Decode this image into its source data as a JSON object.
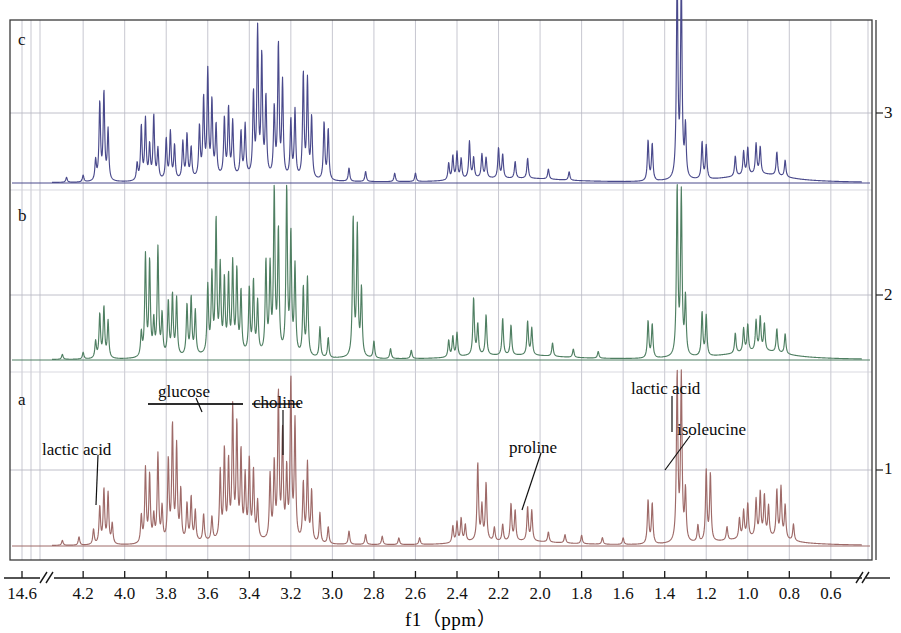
{
  "figure": {
    "kind": "nmr-spectra-stack",
    "x_axis_title": "f1（ppm）",
    "x_tick_labels": [
      "14.6",
      "4.2",
      "4.0",
      "3.8",
      "3.6",
      "3.4",
      "3.2",
      "3.0",
      "2.8",
      "2.6",
      "2.4",
      "2.2",
      "2.0",
      "1.8",
      "1.6",
      "1.4",
      "1.2",
      "1.0",
      "0.8",
      "0.6"
    ],
    "x_axis_has_break": true,
    "y_tick_labels": [
      "3",
      "2",
      "1"
    ],
    "trace_labels": [
      "c",
      "b",
      "a"
    ],
    "colors": {
      "trace_a": "#9e6a68",
      "trace_b": "#4f7f62",
      "trace_c": "#4a4a8c",
      "frame": "#3a3a3a",
      "grid": "#b9b9c4",
      "text": "#111111"
    }
  },
  "annotations": [
    {
      "label": "lactic acid",
      "panel": "a",
      "x_px": 42,
      "y_px": 440,
      "leader": [
        [
          98,
          455
        ],
        [
          96,
          505
        ]
      ]
    },
    {
      "label": "glucose",
      "panel": "a",
      "x_px": 158,
      "y_px": 382,
      "leader": [
        [
          148,
          404
        ],
        [
          243,
          404
        ]
      ]
    },
    {
      "label": "choline",
      "panel": "a",
      "x_px": 253,
      "y_px": 393,
      "leader": [
        [
          283,
          410
        ],
        [
          283,
          455
        ]
      ]
    },
    {
      "label": "proline",
      "panel": "a",
      "x_px": 509,
      "y_px": 438,
      "leader": [
        [
          541,
          453
        ],
        [
          522,
          510
        ]
      ]
    },
    {
      "label": "lactic acid",
      "panel": "a",
      "x_px": 631,
      "y_px": 379,
      "leader": [
        [
          672,
          396
        ],
        [
          672,
          432
        ]
      ]
    },
    {
      "label": "isoleucine",
      "panel": "a",
      "x_px": 677,
      "y_px": 420,
      "leader": [
        [
          690,
          436
        ],
        [
          665,
          470
        ]
      ]
    }
  ],
  "chart_data": {
    "type": "line",
    "title": "",
    "xlabel": "f1（ppm）",
    "ylabel": "",
    "xlim": [
      4.35,
      0.45
    ],
    "grid": true,
    "legend": "none",
    "note": "Stacked 1H NMR spectra: three samples a (bottom), b (middle), c (top). Intensities are relative peak heights (0-1) per panel baseline.",
    "series": [
      {
        "name": "a",
        "color": "#9e6a68",
        "peaks": [
          [
            4.3,
            0.03
          ],
          [
            4.22,
            0.05
          ],
          [
            4.15,
            0.09
          ],
          [
            4.12,
            0.22
          ],
          [
            4.1,
            0.32
          ],
          [
            4.08,
            0.3
          ],
          [
            4.06,
            0.12
          ],
          [
            3.92,
            0.16
          ],
          [
            3.9,
            0.44
          ],
          [
            3.88,
            0.4
          ],
          [
            3.86,
            0.15
          ],
          [
            3.84,
            0.52
          ],
          [
            3.82,
            0.2
          ],
          [
            3.79,
            0.48
          ],
          [
            3.77,
            0.68
          ],
          [
            3.75,
            0.56
          ],
          [
            3.73,
            0.3
          ],
          [
            3.7,
            0.22
          ],
          [
            3.68,
            0.26
          ],
          [
            3.66,
            0.18
          ],
          [
            3.62,
            0.16
          ],
          [
            3.58,
            0.14
          ],
          [
            3.54,
            0.4
          ],
          [
            3.52,
            0.52
          ],
          [
            3.5,
            0.44
          ],
          [
            3.48,
            0.76
          ],
          [
            3.46,
            0.66
          ],
          [
            3.44,
            0.5
          ],
          [
            3.42,
            0.36
          ],
          [
            3.4,
            0.46
          ],
          [
            3.38,
            0.4
          ],
          [
            3.36,
            0.22
          ],
          [
            3.3,
            0.38
          ],
          [
            3.28,
            0.44
          ],
          [
            3.26,
            0.86
          ],
          [
            3.24,
            0.62
          ],
          [
            3.22,
            0.4
          ],
          [
            3.2,
            0.94
          ],
          [
            3.18,
            0.7
          ],
          [
            3.14,
            0.34
          ],
          [
            3.12,
            0.46
          ],
          [
            3.1,
            0.3
          ],
          [
            3.06,
            0.18
          ],
          [
            3.02,
            0.1
          ],
          [
            2.92,
            0.08
          ],
          [
            2.84,
            0.06
          ],
          [
            2.76,
            0.05
          ],
          [
            2.68,
            0.04
          ],
          [
            2.58,
            0.04
          ],
          [
            2.42,
            0.1
          ],
          [
            2.4,
            0.12
          ],
          [
            2.38,
            0.14
          ],
          [
            2.36,
            0.1
          ],
          [
            2.3,
            0.46
          ],
          [
            2.28,
            0.2
          ],
          [
            2.26,
            0.34
          ],
          [
            2.22,
            0.08
          ],
          [
            2.18,
            0.1
          ],
          [
            2.14,
            0.22
          ],
          [
            2.12,
            0.18
          ],
          [
            2.06,
            0.2
          ],
          [
            2.04,
            0.18
          ],
          [
            1.96,
            0.06
          ],
          [
            1.88,
            0.05
          ],
          [
            1.8,
            0.05
          ],
          [
            1.7,
            0.04
          ],
          [
            1.6,
            0.04
          ],
          [
            1.48,
            0.26
          ],
          [
            1.46,
            0.24
          ],
          [
            1.34,
            1.0
          ],
          [
            1.32,
            0.98
          ],
          [
            1.3,
            0.3
          ],
          [
            1.24,
            0.1
          ],
          [
            1.2,
            0.42
          ],
          [
            1.18,
            0.4
          ],
          [
            1.1,
            0.08
          ],
          [
            1.04,
            0.12
          ],
          [
            1.02,
            0.16
          ],
          [
            1.0,
            0.2
          ],
          [
            0.96,
            0.22
          ],
          [
            0.94,
            0.26
          ],
          [
            0.92,
            0.24
          ],
          [
            0.9,
            0.18
          ],
          [
            0.86,
            0.28
          ],
          [
            0.84,
            0.3
          ],
          [
            0.82,
            0.2
          ],
          [
            0.78,
            0.1
          ]
        ]
      },
      {
        "name": "b",
        "color": "#4f7f62",
        "peaks": [
          [
            4.3,
            0.03
          ],
          [
            4.2,
            0.04
          ],
          [
            4.14,
            0.1
          ],
          [
            4.12,
            0.26
          ],
          [
            4.1,
            0.3
          ],
          [
            4.08,
            0.22
          ],
          [
            3.92,
            0.14
          ],
          [
            3.9,
            0.6
          ],
          [
            3.88,
            0.56
          ],
          [
            3.86,
            0.2
          ],
          [
            3.84,
            0.64
          ],
          [
            3.82,
            0.24
          ],
          [
            3.79,
            0.32
          ],
          [
            3.77,
            0.36
          ],
          [
            3.75,
            0.34
          ],
          [
            3.7,
            0.3
          ],
          [
            3.68,
            0.34
          ],
          [
            3.66,
            0.26
          ],
          [
            3.6,
            0.4
          ],
          [
            3.58,
            0.46
          ],
          [
            3.56,
            0.78
          ],
          [
            3.54,
            0.5
          ],
          [
            3.52,
            0.42
          ],
          [
            3.5,
            0.44
          ],
          [
            3.48,
            0.52
          ],
          [
            3.46,
            0.48
          ],
          [
            3.44,
            0.36
          ],
          [
            3.4,
            0.38
          ],
          [
            3.38,
            0.42
          ],
          [
            3.36,
            0.3
          ],
          [
            3.32,
            0.54
          ],
          [
            3.3,
            0.5
          ],
          [
            3.28,
            0.96
          ],
          [
            3.26,
            0.72
          ],
          [
            3.22,
            0.98
          ],
          [
            3.2,
            0.7
          ],
          [
            3.18,
            0.52
          ],
          [
            3.14,
            0.4
          ],
          [
            3.12,
            0.46
          ],
          [
            3.06,
            0.18
          ],
          [
            3.02,
            0.12
          ],
          [
            2.9,
            0.82
          ],
          [
            2.88,
            0.76
          ],
          [
            2.86,
            0.4
          ],
          [
            2.8,
            0.1
          ],
          [
            2.72,
            0.06
          ],
          [
            2.62,
            0.05
          ],
          [
            2.44,
            0.1
          ],
          [
            2.42,
            0.12
          ],
          [
            2.4,
            0.14
          ],
          [
            2.32,
            0.34
          ],
          [
            2.3,
            0.18
          ],
          [
            2.26,
            0.24
          ],
          [
            2.18,
            0.22
          ],
          [
            2.14,
            0.18
          ],
          [
            2.06,
            0.2
          ],
          [
            2.04,
            0.16
          ],
          [
            1.94,
            0.08
          ],
          [
            1.84,
            0.05
          ],
          [
            1.72,
            0.04
          ],
          [
            1.48,
            0.22
          ],
          [
            1.46,
            0.2
          ],
          [
            1.34,
            1.0
          ],
          [
            1.32,
            0.96
          ],
          [
            1.3,
            0.34
          ],
          [
            1.22,
            0.26
          ],
          [
            1.2,
            0.24
          ],
          [
            1.06,
            0.12
          ],
          [
            1.02,
            0.14
          ],
          [
            1.0,
            0.16
          ],
          [
            0.96,
            0.18
          ],
          [
            0.94,
            0.2
          ],
          [
            0.92,
            0.16
          ],
          [
            0.86,
            0.14
          ],
          [
            0.82,
            0.12
          ]
        ]
      },
      {
        "name": "c",
        "color": "#4a4a8c",
        "peaks": [
          [
            4.28,
            0.03
          ],
          [
            4.2,
            0.04
          ],
          [
            4.14,
            0.12
          ],
          [
            4.12,
            0.46
          ],
          [
            4.1,
            0.52
          ],
          [
            4.08,
            0.3
          ],
          [
            3.94,
            0.1
          ],
          [
            3.92,
            0.32
          ],
          [
            3.9,
            0.36
          ],
          [
            3.88,
            0.2
          ],
          [
            3.86,
            0.38
          ],
          [
            3.84,
            0.18
          ],
          [
            3.8,
            0.24
          ],
          [
            3.78,
            0.28
          ],
          [
            3.76,
            0.2
          ],
          [
            3.72,
            0.22
          ],
          [
            3.7,
            0.26
          ],
          [
            3.68,
            0.18
          ],
          [
            3.64,
            0.3
          ],
          [
            3.62,
            0.46
          ],
          [
            3.6,
            0.62
          ],
          [
            3.58,
            0.44
          ],
          [
            3.56,
            0.3
          ],
          [
            3.52,
            0.34
          ],
          [
            3.5,
            0.4
          ],
          [
            3.48,
            0.32
          ],
          [
            3.44,
            0.26
          ],
          [
            3.42,
            0.3
          ],
          [
            3.38,
            0.48
          ],
          [
            3.36,
            0.86
          ],
          [
            3.34,
            0.7
          ],
          [
            3.32,
            0.46
          ],
          [
            3.28,
            0.4
          ],
          [
            3.26,
            0.78
          ],
          [
            3.24,
            0.56
          ],
          [
            3.2,
            0.34
          ],
          [
            3.18,
            0.4
          ],
          [
            3.14,
            0.62
          ],
          [
            3.12,
            0.58
          ],
          [
            3.1,
            0.36
          ],
          [
            3.04,
            0.34
          ],
          [
            3.02,
            0.3
          ],
          [
            2.92,
            0.08
          ],
          [
            2.84,
            0.06
          ],
          [
            2.7,
            0.05
          ],
          [
            2.6,
            0.05
          ],
          [
            2.44,
            0.1
          ],
          [
            2.42,
            0.14
          ],
          [
            2.4,
            0.16
          ],
          [
            2.38,
            0.12
          ],
          [
            2.34,
            0.22
          ],
          [
            2.32,
            0.12
          ],
          [
            2.28,
            0.14
          ],
          [
            2.26,
            0.12
          ],
          [
            2.2,
            0.18
          ],
          [
            2.18,
            0.14
          ],
          [
            2.12,
            0.1
          ],
          [
            2.06,
            0.12
          ],
          [
            1.96,
            0.06
          ],
          [
            1.86,
            0.05
          ],
          [
            1.48,
            0.24
          ],
          [
            1.46,
            0.22
          ],
          [
            1.34,
            1.22
          ],
          [
            1.32,
            1.18
          ],
          [
            1.3,
            0.3
          ],
          [
            1.22,
            0.22
          ],
          [
            1.2,
            0.2
          ],
          [
            1.06,
            0.12
          ],
          [
            1.02,
            0.14
          ],
          [
            1.0,
            0.16
          ],
          [
            0.96,
            0.18
          ],
          [
            0.94,
            0.16
          ],
          [
            0.86,
            0.14
          ],
          [
            0.82,
            0.1
          ]
        ]
      }
    ]
  }
}
